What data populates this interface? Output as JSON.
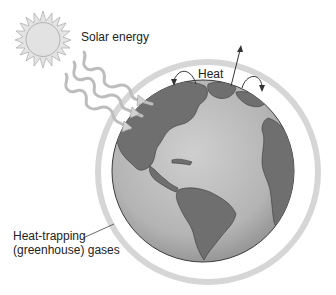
{
  "figure": {
    "topic": "Greenhouse effect",
    "labels": {
      "solar_energy": "Solar energy",
      "heat": "Heat",
      "gases_line1": "Heat-trapping",
      "gases_line2": "(greenhouse) gases"
    },
    "elements": {
      "sun": "sun-icon",
      "solar_rays": 3,
      "heat_arrows": [
        "curved-arrow-returning-left",
        "arrow-escaping-up",
        "curved-arrow-returning-right"
      ],
      "globe": "earth-globe-americas",
      "atmosphere_ring": "greenhouse-gas-layer"
    },
    "colors": {
      "background": "#ffffff",
      "sun_fill": "#e6e6e6",
      "sun_stroke": "#a8a8a8",
      "ray_stroke": "#b8b8b8",
      "ring": "#d4d4d4",
      "ocean": "#b9b9b9",
      "land": "#6e6e6e",
      "outline": "#333333",
      "text": "#222222"
    }
  }
}
